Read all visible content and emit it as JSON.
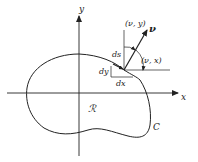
{
  "diagram": {
    "axes": {
      "x_label": "x",
      "y_label": "y"
    },
    "region_label": "ℛ",
    "curve_label": "C",
    "normal_label": "ν",
    "angle_labels": {
      "nu_y": "(ν, y)",
      "nu_x": "(ν, x)"
    },
    "differentials": {
      "ds": "ds",
      "dx": "dx",
      "dy": "dy"
    },
    "colors": {
      "stroke": "#222222",
      "background": "#ffffff"
    }
  }
}
